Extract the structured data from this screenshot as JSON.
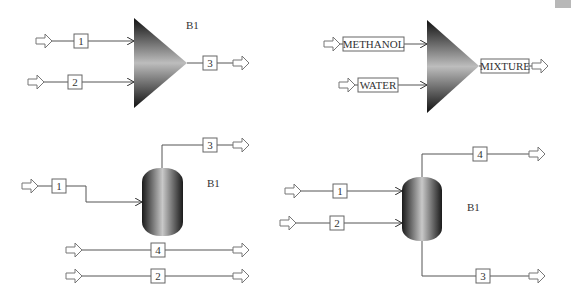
{
  "colors": {
    "stream": "#555555",
    "box_border": "#666666",
    "block_dark": "#1a1a1a",
    "block_light": "#bdbdbd",
    "corner_tab": "#b8b8b8"
  },
  "diagrams": [
    {
      "id": "mixer-numbered",
      "type": "mixer",
      "block_label": "B1",
      "inlets": [
        {
          "stream": "1"
        },
        {
          "stream": "2"
        }
      ],
      "outlets": [
        {
          "stream": "3"
        }
      ]
    },
    {
      "id": "mixer-named",
      "type": "mixer",
      "block_label": "",
      "inlets": [
        {
          "stream": "METHANOL"
        },
        {
          "stream": "WATER"
        }
      ],
      "outlets": [
        {
          "stream": "MIXTURE"
        }
      ]
    },
    {
      "id": "flash-single-feed",
      "type": "flash-drum",
      "block_label": "B1",
      "inlets": [
        {
          "stream": "1"
        }
      ],
      "outlets": [
        {
          "stream": "3"
        }
      ],
      "bypass_streams": [
        {
          "stream": "4"
        },
        {
          "stream": "2"
        }
      ]
    },
    {
      "id": "flash-two-feeds",
      "type": "flash-drum",
      "block_label": "B1",
      "inlets": [
        {
          "stream": "1"
        },
        {
          "stream": "2"
        }
      ],
      "outlets": [
        {
          "stream": "4",
          "position": "top"
        },
        {
          "stream": "3",
          "position": "bottom"
        }
      ]
    }
  ]
}
